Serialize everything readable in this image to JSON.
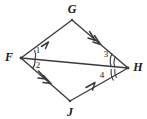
{
  "figure": {
    "type": "geometry-diagram",
    "shape": "quadrilateral",
    "background_color": "#ffffff",
    "stroke_color": "#3a3a3a",
    "label_color": "#1a1a1a",
    "width": 147,
    "height": 119
  },
  "vertices": [
    {
      "id": "G",
      "label": "G",
      "point_x": 72,
      "point_y": 20,
      "label_x": 72,
      "label_y": 9
    },
    {
      "id": "F",
      "label": "F",
      "point_x": 21,
      "point_y": 58,
      "label_x": 9,
      "label_y": 57
    },
    {
      "id": "H",
      "label": "H",
      "point_x": 128,
      "point_y": 68,
      "label_x": 138,
      "label_y": 67
    },
    {
      "id": "J",
      "label": "J",
      "point_x": 70,
      "point_y": 101,
      "label_x": 70,
      "label_y": 112
    }
  ],
  "edges": [
    {
      "id": "FG",
      "from": "F",
      "to": "G",
      "marks": 1,
      "mark_direction": "toward-G"
    },
    {
      "id": "GH",
      "from": "G",
      "to": "H",
      "marks": 2,
      "mark_direction": "toward-H"
    },
    {
      "id": "FJ",
      "from": "F",
      "to": "J",
      "marks": 2,
      "mark_direction": "toward-J"
    },
    {
      "id": "JH",
      "from": "J",
      "to": "H",
      "marks": 1,
      "mark_direction": "toward-H"
    },
    {
      "id": "FH",
      "from": "F",
      "to": "H",
      "marks": 0,
      "mark_direction": "none",
      "note": "diagonal"
    }
  ],
  "angles": [
    {
      "id": "a1",
      "label": "1",
      "vertex": "F",
      "arcs": 1,
      "label_x": 38,
      "label_y": 50
    },
    {
      "id": "a2",
      "label": "2",
      "vertex": "F",
      "arcs": 1,
      "label_x": 38,
      "label_y": 65
    },
    {
      "id": "a3",
      "label": "3",
      "vertex": "H",
      "arcs": 2,
      "label_x": 106,
      "label_y": 54
    },
    {
      "id": "a4",
      "label": "4",
      "vertex": "H",
      "arcs": 2,
      "label_x": 102,
      "label_y": 75
    }
  ]
}
